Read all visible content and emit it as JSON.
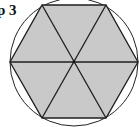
{
  "step_label": "p 3",
  "figure": {
    "type": "regular hexagon inscribed in circle, divided into 6 equilateral triangles",
    "circle": {
      "cx": 74,
      "cy": 62,
      "r": 64,
      "stroke": "#222222"
    },
    "hexagon": {
      "vertices": [
        [
          42,
          5
        ],
        [
          106,
          5
        ],
        [
          138,
          62
        ],
        [
          106,
          118
        ],
        [
          42,
          118
        ],
        [
          10,
          62
        ]
      ],
      "fill": "#c9c9c9",
      "stroke": "#1e1e1e"
    },
    "center": [
      74,
      62
    ],
    "triangle_count": 6
  }
}
